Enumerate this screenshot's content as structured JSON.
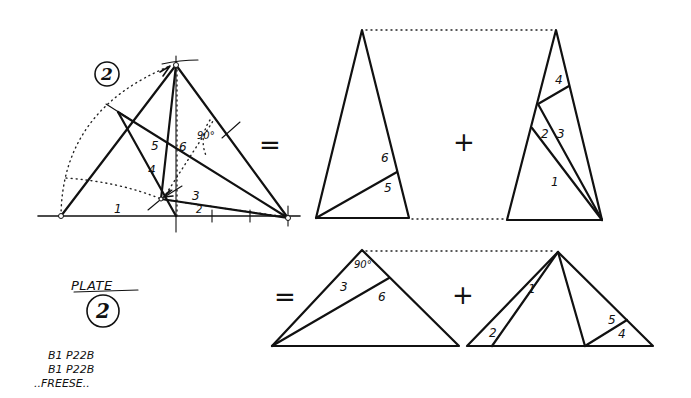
{
  "construction": {
    "step_number": "2",
    "angle_label": "90°",
    "piece_labels": [
      "1",
      "2",
      "3",
      "4",
      "5",
      "6"
    ]
  },
  "equation_top": {
    "equals_sign": "=",
    "plus_sign": "+",
    "left_piece_labels": [
      "6",
      "5"
    ],
    "right_piece_labels": [
      "4",
      "2",
      "3",
      "1"
    ]
  },
  "equation_bottom": {
    "equals_sign": "=",
    "plus_sign": "+",
    "angle_label": "90°",
    "left_piece_labels": [
      "3",
      "6"
    ],
    "right_piece_labels": [
      "1",
      "2",
      "5",
      "4"
    ]
  },
  "plate": {
    "title": "PLATE",
    "number": "2"
  },
  "notes": [
    "B1 P22B",
    "B1 P22B",
    "..FREESE.."
  ]
}
